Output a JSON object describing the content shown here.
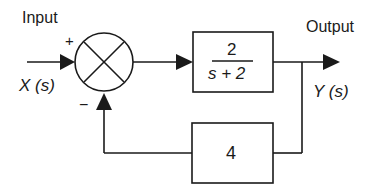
{
  "diagram": {
    "type": "feedback-control-block-diagram",
    "input_label": "Input",
    "input_signal": "X (s)",
    "output_label": "Output",
    "output_signal": "Y (s)",
    "summing_junction": {
      "plus_sign": "+",
      "minus_sign": "−"
    },
    "forward_block": {
      "numerator": "2",
      "denominator": "s + 2"
    },
    "feedback_block": {
      "gain": "4"
    },
    "colors": {
      "line": "#1a1a1a",
      "background": "#ffffff"
    }
  }
}
